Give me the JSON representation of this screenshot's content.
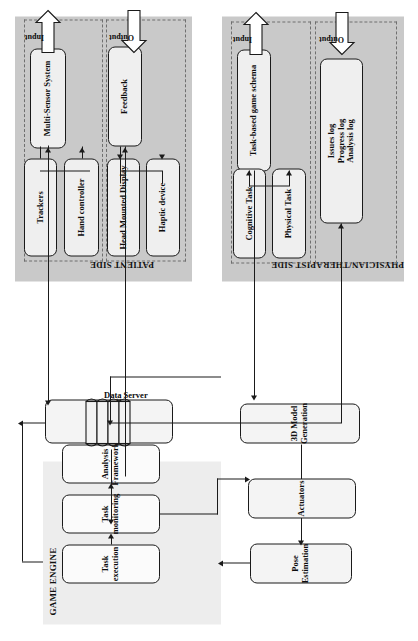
{
  "diagram": {
    "orientation_deg": -90,
    "colors": {
      "panel_gray": "#c9c9c9",
      "panel_light": "#ededed",
      "node_fill": "#f4f4f4",
      "stroke": "#1a1a1a",
      "dashed_border": "#6f6f6f",
      "background": "#ffffff"
    }
  },
  "panels": [
    {
      "id": "game-engine",
      "title": "GAME ENGINE"
    },
    {
      "id": "patient-side",
      "title": "PATIENT SIDE"
    },
    {
      "id": "physician-side",
      "title": "PHYSICIAN/THERAPIST SIDE"
    }
  ],
  "nodes": {
    "pose_estimation": "Pose Estimation",
    "model_generation": "3D Model Generation",
    "actuators": "Actuators",
    "task_execution": "Task execution",
    "task_monitoring": "Task monitoring",
    "analysis_framework": "Analysis Framework",
    "software_program_development": "Software program\ndevelopment",
    "data_server": "Data Server",
    "multi_sensor_system": "Multi-Sensor System",
    "trackers": "Trackers",
    "hand_controller": "Hand controller",
    "feedback": "Feedback",
    "head_mounted_display": "Head Mounted Display",
    "haptic_device": "Haptic device",
    "task_based_game_schema": "Task-based game schema",
    "cognitive_task": "Cognitive Task",
    "physical_task": "Physical Task",
    "logs": "Issues log\nProgress log\nAnalysis log"
  },
  "flow_labels": {
    "patient_input": "Input",
    "patient_output": "Output",
    "physician_input": "Input",
    "physician_output": "Output"
  },
  "edges": [
    {
      "from": "trackers",
      "to": "multi_sensor_system"
    },
    {
      "from": "hand_controller",
      "to": "multi_sensor_system"
    },
    {
      "from": "multi_sensor_system",
      "to": "model_generation"
    },
    {
      "from": "model_generation",
      "to": "pose_estimation"
    },
    {
      "from": "pose_estimation",
      "to": "task_execution"
    },
    {
      "from": "task_execution",
      "to": "task_monitoring"
    },
    {
      "from": "task_monitoring",
      "to": "analysis_framework"
    },
    {
      "from": "task_monitoring",
      "to": "actuators"
    },
    {
      "from": "actuators",
      "to": "feedback"
    },
    {
      "from": "feedback",
      "to": "head_mounted_display"
    },
    {
      "from": "feedback",
      "to": "haptic_device"
    },
    {
      "from": "cognitive_task",
      "to": "task_based_game_schema"
    },
    {
      "from": "physical_task",
      "to": "task_based_game_schema"
    },
    {
      "from": "task_based_game_schema",
      "to": "software_program_development"
    },
    {
      "from": "software_program_development",
      "to": "task_execution"
    },
    {
      "from": "analysis_framework",
      "to": "data_server"
    },
    {
      "from": "data_server",
      "to": "logs"
    }
  ]
}
